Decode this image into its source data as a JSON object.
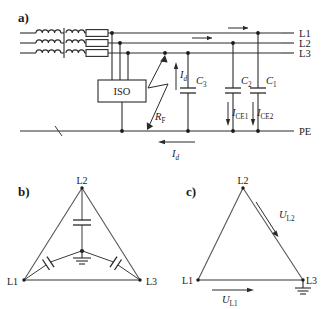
{
  "figure": {
    "title_panels": [
      {
        "key": "a",
        "label": "a)"
      },
      {
        "key": "b",
        "label": "b)"
      },
      {
        "key": "c",
        "label": "c)"
      }
    ]
  },
  "panel_a": {
    "label": "a)",
    "line_labels": [
      {
        "name": "L1",
        "text": "L1"
      },
      {
        "name": "L2",
        "text": "L2"
      },
      {
        "name": "L3",
        "text": "L3"
      }
    ],
    "pe_label": "PE",
    "iso_label": "ISO",
    "fault_resistance_label": "R",
    "fault_resistance_sub": "F",
    "fault_current_label": "I",
    "fault_current_sub": "d",
    "return_current_label": "I",
    "return_current_sub": "d",
    "capacitors": [
      {
        "name": "C3",
        "label": "C",
        "sub": "3"
      },
      {
        "name": "C2",
        "label": "C",
        "sub": "2"
      },
      {
        "name": "C1",
        "label": "C",
        "sub": "1"
      }
    ],
    "earth_currents": [
      {
        "name": "ICE1",
        "label": "I",
        "sub": "CE1"
      },
      {
        "name": "ICE2",
        "label": "I",
        "sub": "CE2"
      }
    ],
    "transformer": {
      "primary_windings": 3,
      "secondary_windings": 3,
      "fuse_count": 3
    }
  },
  "panel_b": {
    "label": "b)",
    "vertices": [
      {
        "name": "L2",
        "text": "L2",
        "position": "top"
      },
      {
        "name": "L1",
        "text": "L1",
        "position": "bottom-left"
      },
      {
        "name": "L3",
        "text": "L3",
        "position": "bottom-right"
      }
    ],
    "capacitor_count": 3,
    "has_center_ground": true
  },
  "panel_c": {
    "label": "c)",
    "vertices": [
      {
        "name": "L2",
        "text": "L2",
        "position": "top"
      },
      {
        "name": "L1",
        "text": "L1",
        "position": "bottom-left"
      },
      {
        "name": "L3",
        "text": "L3",
        "position": "bottom-right"
      }
    ],
    "voltages": [
      {
        "name": "UL2",
        "label": "U",
        "sub": "L2"
      },
      {
        "name": "UL1",
        "label": "U",
        "sub": "L1"
      }
    ],
    "has_ground_at_l3": true
  },
  "colors": {
    "ink": "#1a1a1a",
    "wire": "#2a2a2a",
    "triangle": "#555555",
    "background": "#ffffff"
  }
}
